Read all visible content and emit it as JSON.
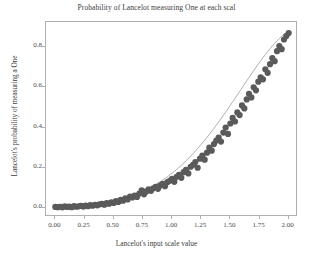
{
  "chart_data": {
    "type": "scatter",
    "title": "Probability of Lancelot measuring One at each scal",
    "xlabel": "Lancelot's input scale value",
    "ylabel": "Lancelot's probability of measuring a One",
    "xlim": [
      -0.08,
      2.08
    ],
    "ylim": [
      -0.045,
      0.925
    ],
    "xticks": [
      "0.00",
      "0.25",
      "0.50",
      "0.75",
      "1.00",
      "1.25",
      "1.50",
      "1.75",
      "2.00"
    ],
    "xtick_values": [
      0.0,
      0.25,
      0.5,
      0.75,
      1.0,
      1.25,
      1.5,
      1.75,
      2.0
    ],
    "yticks": [
      "0.0",
      "0.2",
      "0.4",
      "0.6",
      "0.8"
    ],
    "ytick_values": [
      0.0,
      0.2,
      0.4,
      0.6,
      0.8
    ],
    "grid": false,
    "legend": null,
    "marker_color": "#5a5a5a",
    "line_color": "#8c8c8c",
    "marker_size": 3.1,
    "has_connecting_line": true,
    "series": [
      {
        "name": "Lancelot's measured probability",
        "x": [
          0.0,
          0.02,
          0.04,
          0.06,
          0.08,
          0.1,
          0.12,
          0.14,
          0.16,
          0.18,
          0.2,
          0.22,
          0.24,
          0.26,
          0.28,
          0.3,
          0.32,
          0.34,
          0.36,
          0.38,
          0.4,
          0.42,
          0.44,
          0.46,
          0.48,
          0.5,
          0.52,
          0.54,
          0.56,
          0.58,
          0.6,
          0.62,
          0.64,
          0.66,
          0.68,
          0.7,
          0.72,
          0.74,
          0.76,
          0.78,
          0.8,
          0.82,
          0.84,
          0.86,
          0.88,
          0.9,
          0.92,
          0.94,
          0.96,
          0.98,
          1.0,
          1.02,
          1.04,
          1.06,
          1.08,
          1.1,
          1.12,
          1.14,
          1.16,
          1.18,
          1.2,
          1.22,
          1.24,
          1.26,
          1.28,
          1.3,
          1.32,
          1.34,
          1.36,
          1.38,
          1.4,
          1.42,
          1.44,
          1.46,
          1.48,
          1.5,
          1.52,
          1.54,
          1.56,
          1.58,
          1.6,
          1.62,
          1.64,
          1.66,
          1.68,
          1.7,
          1.72,
          1.74,
          1.76,
          1.78,
          1.8,
          1.82,
          1.84,
          1.86,
          1.88,
          1.9,
          1.92,
          1.94,
          1.96,
          1.98,
          2.0
        ],
        "y": [
          0.005,
          0.004,
          0.006,
          0.003,
          0.008,
          0.005,
          0.007,
          0.004,
          0.009,
          0.006,
          0.008,
          0.01,
          0.007,
          0.012,
          0.009,
          0.014,
          0.011,
          0.016,
          0.013,
          0.018,
          0.02,
          0.016,
          0.024,
          0.021,
          0.028,
          0.025,
          0.034,
          0.03,
          0.04,
          0.036,
          0.048,
          0.042,
          0.056,
          0.052,
          0.062,
          0.055,
          0.072,
          0.088,
          0.068,
          0.082,
          0.092,
          0.085,
          0.098,
          0.105,
          0.095,
          0.112,
          0.12,
          0.108,
          0.128,
          0.135,
          0.145,
          0.13,
          0.155,
          0.165,
          0.15,
          0.178,
          0.19,
          0.172,
          0.205,
          0.215,
          0.228,
          0.2,
          0.245,
          0.26,
          0.24,
          0.275,
          0.3,
          0.285,
          0.318,
          0.335,
          0.35,
          0.33,
          0.375,
          0.4,
          0.368,
          0.42,
          0.448,
          0.43,
          0.475,
          0.462,
          0.51,
          0.495,
          0.54,
          0.568,
          0.55,
          0.6,
          0.585,
          0.628,
          0.65,
          0.64,
          0.69,
          0.672,
          0.715,
          0.745,
          0.73,
          0.78,
          0.805,
          0.79,
          0.838,
          0.855,
          0.87
        ],
        "y_fit": [
          0.003,
          0.003,
          0.004,
          0.005,
          0.005,
          0.006,
          0.007,
          0.008,
          0.008,
          0.009,
          0.01,
          0.011,
          0.012,
          0.013,
          0.014,
          0.016,
          0.017,
          0.019,
          0.02,
          0.022,
          0.024,
          0.026,
          0.028,
          0.03,
          0.033,
          0.035,
          0.038,
          0.041,
          0.044,
          0.047,
          0.051,
          0.054,
          0.058,
          0.062,
          0.067,
          0.071,
          0.076,
          0.081,
          0.086,
          0.092,
          0.098,
          0.104,
          0.11,
          0.117,
          0.124,
          0.131,
          0.139,
          0.147,
          0.155,
          0.164,
          0.173,
          0.182,
          0.192,
          0.202,
          0.212,
          0.223,
          0.234,
          0.246,
          0.258,
          0.27,
          0.283,
          0.296,
          0.309,
          0.323,
          0.337,
          0.351,
          0.366,
          0.381,
          0.396,
          0.412,
          0.428,
          0.444,
          0.46,
          0.477,
          0.494,
          0.511,
          0.528,
          0.545,
          0.562,
          0.58,
          0.597,
          0.614,
          0.632,
          0.649,
          0.666,
          0.683,
          0.7,
          0.716,
          0.732,
          0.748,
          0.763,
          0.778,
          0.792,
          0.806,
          0.819,
          0.831,
          0.843,
          0.854,
          0.864,
          0.873,
          0.881
        ]
      }
    ]
  }
}
